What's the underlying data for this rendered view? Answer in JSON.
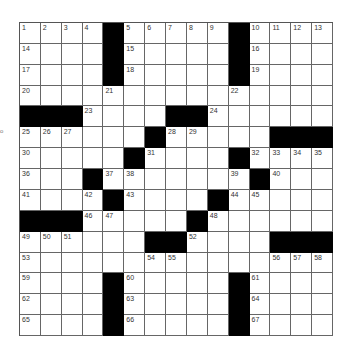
{
  "puzzle": {
    "size": 15,
    "side_mark": "o",
    "colors": {
      "block": "#000000",
      "cell": "#ffffff",
      "line": "#666666",
      "number": "#333333"
    },
    "rows": [
      [
        "1",
        "2",
        "3",
        "4",
        "#",
        "5",
        "6",
        "7",
        "8",
        "9",
        "#",
        "10",
        "11",
        "12",
        "13"
      ],
      [
        "14",
        "",
        "",
        "",
        "#",
        "15",
        "",
        "",
        "",
        "",
        "#",
        "16",
        "",
        "",
        ""
      ],
      [
        "17",
        "",
        "",
        "",
        "#",
        "18",
        "",
        "",
        "",
        "",
        "#",
        "19",
        "",
        "",
        ""
      ],
      [
        "20",
        "",
        "",
        "",
        "21",
        "",
        "",
        "",
        "",
        "",
        "22",
        "",
        "",
        "",
        ""
      ],
      [
        "#",
        "#",
        "#",
        "23",
        "",
        "",
        "",
        "#",
        "#",
        "24",
        "",
        "",
        "",
        "",
        ""
      ],
      [
        "25",
        "26",
        "27",
        "",
        "",
        "",
        "#",
        "28",
        "29",
        "",
        "",
        "",
        "#",
        "#",
        "#"
      ],
      [
        "30",
        "",
        "",
        "",
        "",
        "#",
        "31",
        "",
        "",
        "",
        "#",
        "32",
        "33",
        "34",
        "35"
      ],
      [
        "36",
        "",
        "",
        "#",
        "37",
        "38",
        "",
        "",
        "",
        "",
        "39",
        "#",
        "40",
        "",
        ""
      ],
      [
        "41",
        "",
        "",
        "42",
        "#",
        "43",
        "",
        "",
        "",
        "#",
        "44",
        "45",
        "",
        "",
        ""
      ],
      [
        "#",
        "#",
        "#",
        "46",
        "47",
        "",
        "",
        "",
        "#",
        "48",
        "",
        "",
        "",
        "",
        ""
      ],
      [
        "49",
        "50",
        "51",
        "",
        "",
        "",
        "#",
        "#",
        "52",
        "",
        "",
        "",
        "#",
        "#",
        "#"
      ],
      [
        "53",
        "",
        "",
        "",
        "",
        "",
        "54",
        "55",
        "",
        "",
        "",
        "",
        "56",
        "57",
        "58"
      ],
      [
        "59",
        "",
        "",
        "",
        "#",
        "60",
        "",
        "",
        "",
        "",
        "#",
        "61",
        "",
        "",
        ""
      ],
      [
        "62",
        "",
        "",
        "",
        "#",
        "63",
        "",
        "",
        "",
        "",
        "#",
        "64",
        "",
        "",
        ""
      ],
      [
        "65",
        "",
        "",
        "",
        "#",
        "66",
        "",
        "",
        "",
        "",
        "#",
        "67",
        "",
        "",
        ""
      ]
    ]
  }
}
